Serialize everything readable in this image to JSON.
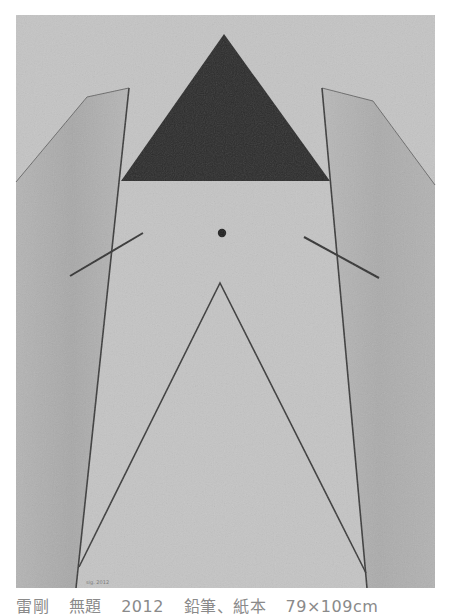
{
  "artwork": {
    "colors": {
      "paper": "#c4c4c4",
      "panel_shade": "#b0b0b0",
      "panel_shade_dark": "#a2a2a2",
      "triangle": "#2b2b2b",
      "line": "#3a3a3a",
      "page_bg": "#ffffff"
    },
    "signature": "sig. 2012"
  },
  "caption": {
    "artist": "雷剛",
    "title": "無題",
    "year": "2012",
    "medium": "鉛筆、紙本",
    "size": "79×109cm"
  }
}
